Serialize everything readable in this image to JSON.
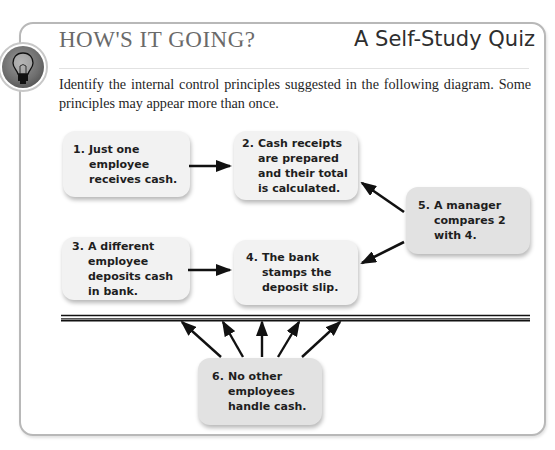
{
  "header": {
    "title": "HOW'S IT GOING?",
    "subtitle": "A Self-Study Quiz",
    "icon": "lightbulb-icon"
  },
  "instructions": "Identify the internal control principles suggested in the following diagram. Some principles may appear more than once.",
  "diagram": {
    "boxes": [
      {
        "num": "1.",
        "text": "Just one employee receives cash."
      },
      {
        "num": "2.",
        "text": "Cash receipts are prepared and their total is calculated."
      },
      {
        "num": "3.",
        "text": "A different employee deposits cash in bank."
      },
      {
        "num": "4.",
        "text": "The bank stamps the deposit slip."
      },
      {
        "num": "5.",
        "text": "A manager compares 2 with 4."
      },
      {
        "num": "6.",
        "text": "No other employees handle cash."
      }
    ],
    "arrows": [
      {
        "from": "1",
        "to": "2"
      },
      {
        "from": "3",
        "to": "4"
      },
      {
        "from": "5",
        "to": "2"
      },
      {
        "from": "5",
        "to": "4"
      },
      {
        "from": "6",
        "to": "boundary-line",
        "count": 5
      }
    ],
    "colors": {
      "box_light": "#f2f2f2",
      "box_dark": "#e2e2e2",
      "arrow": "#111111",
      "border": "#b8b8b8"
    }
  }
}
